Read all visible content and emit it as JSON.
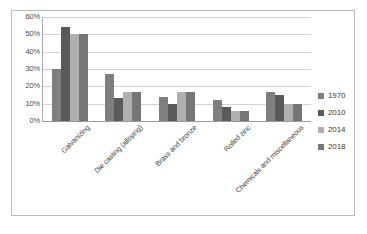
{
  "chart_data": {
    "type": "bar",
    "title": "",
    "subtitle": "",
    "xlabel": "",
    "ylabel": "",
    "ylim": [
      0,
      60
    ],
    "ytick_labels": [
      "60%",
      "50%",
      "40%",
      "30%",
      "20%",
      "10%",
      "0%"
    ],
    "ytick_values": [
      60,
      50,
      40,
      30,
      20,
      10,
      0
    ],
    "grid": true,
    "legend_position": "right",
    "categories": [
      "Galvanizing",
      "Die casting (alloying)",
      "Brass and bronze",
      "Rolled zinc",
      "Chemicals and miscellaneous"
    ],
    "series": [
      {
        "name": "1970",
        "color": "#7f7f7f",
        "values": [
          30,
          27,
          14,
          12,
          17
        ]
      },
      {
        "name": "2010",
        "color": "#5a5a5a",
        "values": [
          54,
          13,
          10,
          8,
          15
        ]
      },
      {
        "name": "2014",
        "color": "#b0b0b0",
        "values": [
          50,
          17,
          17,
          6,
          10
        ]
      },
      {
        "name": "2018",
        "color": "#767676",
        "values": [
          50,
          17,
          17,
          6,
          10
        ]
      }
    ]
  },
  "legend": {
    "items": [
      {
        "label": "1970"
      },
      {
        "label": "2010"
      },
      {
        "label": "2014"
      },
      {
        "label": "2018"
      }
    ]
  },
  "colors": {
    "frame_border": "#b9b9b9",
    "gridline": "#d3d3d3",
    "axis": "#9a9a9a",
    "tick_text": "#4c4c4c",
    "label_text": "#3f3f3f",
    "background": "#ffffff"
  }
}
